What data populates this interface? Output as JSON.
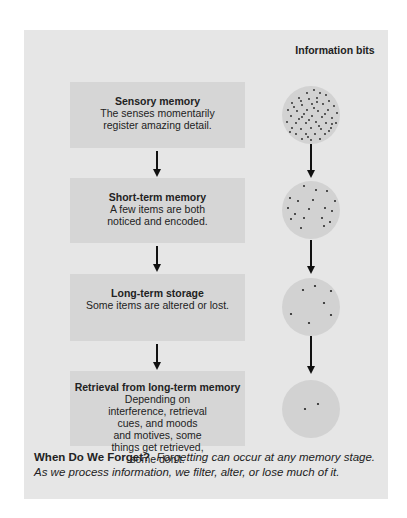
{
  "figure": {
    "column_header": "Information bits",
    "stages": [
      {
        "title": "Sensory memory",
        "description": "The senses momentarily register amazing detail.",
        "dot_count": 55
      },
      {
        "title": "Short-term memory",
        "description": "A few items are both noticed and encoded.",
        "dot_count": 18
      },
      {
        "title": "Long-term storage",
        "description": "Some items are altered or lost.",
        "dot_count": 7
      },
      {
        "title": "Retrieval from long-term memory",
        "description": "Depending on interference, retrieval cues, and moods and motives, some things get retrieved, some don’t.",
        "dot_count": 2
      }
    ],
    "caption": {
      "title": "When Do We Forget?",
      "body": "Forgetting can occur at any memory stage. As we process information, we filter, alter, or lose much of it."
    },
    "colors": {
      "panel": "#e6e6e6",
      "box": "#d6d6d6",
      "circle": "#d2d2d2",
      "arrow": "#111111",
      "dot": "#222222"
    }
  }
}
